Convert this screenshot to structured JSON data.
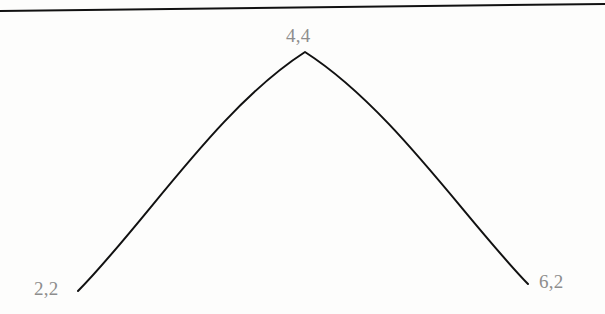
{
  "figure": {
    "name": "parabolic-curve-figure",
    "background_color": "#fdfdfc",
    "width": 605,
    "height": 314
  },
  "top_rule": {
    "name": "top-horizontal-rule",
    "color": "#111111",
    "thickness": 2,
    "x1": 0,
    "y1": 11,
    "x2": 605,
    "y2": 4
  },
  "curve": {
    "name": "parabola-curve",
    "color": "#111111",
    "thickness": 2,
    "path": "M 78 291 C 146 222 218 108 305 52 C 392 108 464 218 528 284"
  },
  "labels": {
    "start": "2,2",
    "vertex": "4,4",
    "end": "6,2",
    "color": "#8d8d8d"
  },
  "chart_data": {
    "type": "line",
    "title": "",
    "subtitle": "",
    "xlabel": "",
    "ylabel": "",
    "grid": false,
    "legend": null,
    "annotations": [
      "2,2",
      "4,4",
      "6,2"
    ],
    "series": [
      {
        "name": "parabola",
        "points": [
          {
            "x": 2,
            "y": 2,
            "label": "2,2"
          },
          {
            "x": 4,
            "y": 4,
            "label": "4,4"
          },
          {
            "x": 6,
            "y": 2,
            "label": "6,2"
          }
        ],
        "x": [
          2,
          4,
          6
        ],
        "values": [
          2,
          4,
          2
        ]
      }
    ],
    "xlim": [
      2,
      6
    ],
    "ylim": [
      2,
      4
    ]
  }
}
